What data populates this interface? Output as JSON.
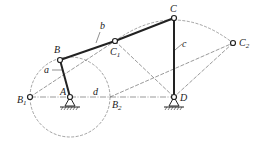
{
  "diagram": {
    "type": "four-bar linkage",
    "colors": {
      "link": "#222222",
      "construction": "#555555",
      "background": "#ffffff"
    },
    "points": {
      "A": {
        "label": "A",
        "sub": "",
        "x": 70,
        "y": 97
      },
      "B": {
        "label": "B",
        "sub": "",
        "x": 60,
        "y": 60
      },
      "B1": {
        "label": "B",
        "sub": "1",
        "x": 30,
        "y": 97
      },
      "B2": {
        "label": "B",
        "sub": "2",
        "x": 110,
        "y": 97
      },
      "C": {
        "label": "C",
        "sub": "",
        "x": 174,
        "y": 18
      },
      "C1": {
        "label": "C",
        "sub": "1",
        "x": 115,
        "y": 41
      },
      "C2": {
        "label": "C",
        "sub": "2",
        "x": 233,
        "y": 43
      },
      "D": {
        "label": "D",
        "sub": "",
        "x": 174,
        "y": 97
      }
    },
    "links": {
      "a": {
        "label": "a",
        "from": "A",
        "to": "B"
      },
      "b": {
        "label": "b",
        "from": "B",
        "to": "C1"
      },
      "c": {
        "label": "c",
        "from": "C",
        "to": "D"
      },
      "d": {
        "label": "d",
        "from": "A",
        "to": "D"
      }
    },
    "circle": {
      "center": "A",
      "radius": 40
    }
  }
}
